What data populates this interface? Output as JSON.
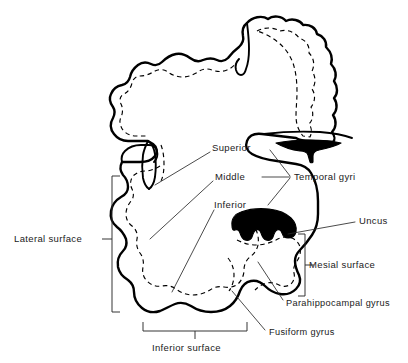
{
  "figure": {
    "background_color": "#ffffff",
    "ink_color": "#000000",
    "leader_color": "#2b2b2b"
  },
  "labels": {
    "superior": "Superior",
    "middle": "Middle",
    "inferior": "Inferior",
    "temporal_gyri": "Temporal gyri",
    "uncus": "Uncus",
    "mesial_surface": "Mesial surface",
    "parahippocampal_gyrus": "Parahippocampal gyrus",
    "fusiform_gyrus": "Fusiform gyrus",
    "lateral_surface": "Lateral surface",
    "inferior_surface": "Inferior surface"
  },
  "structures": [
    {
      "name": "uncus",
      "style": "black-filled",
      "label": "Uncus"
    },
    {
      "name": "brainstem-wedge",
      "style": "black-filled",
      "label": ""
    },
    {
      "name": "cortex-outline",
      "style": "solid-outline",
      "label": ""
    },
    {
      "name": "white-matter-boundary",
      "style": "dashed-contour",
      "label": ""
    }
  ],
  "brackets": [
    {
      "name": "lateral-surface-bracket",
      "orientation": "vertical",
      "label": "Lateral surface"
    },
    {
      "name": "mesial-surface-bracket",
      "orientation": "vertical",
      "label": "Mesial surface"
    },
    {
      "name": "inferior-surface-bracket",
      "orientation": "horizontal",
      "label": "Inferior surface"
    },
    {
      "name": "temporal-gyri-bracket",
      "orientation": "converging",
      "label": "Temporal gyri"
    }
  ]
}
